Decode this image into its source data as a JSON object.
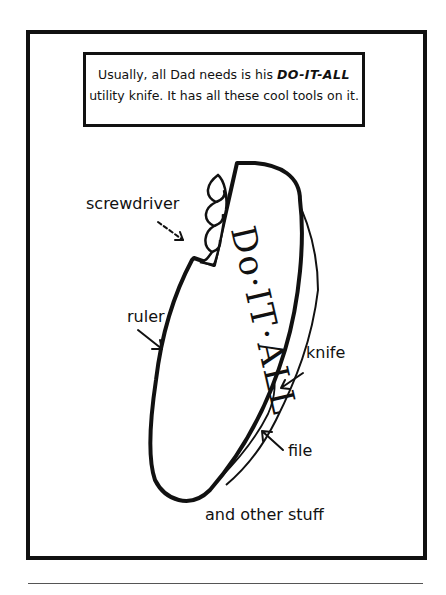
{
  "caption": {
    "line1_prefix": "Usually, all Dad needs is his ",
    "line1_emphasis": "DO-IT-ALL",
    "line2": "utility knife. It has all these cool tools on it."
  },
  "knife": {
    "brand_text": "Do·IT·ALL"
  },
  "labels": {
    "screwdriver": "screwdriver",
    "ruler": "ruler",
    "knife": "knife",
    "file": "file",
    "other": "and other stuff"
  },
  "colors": {
    "ink": "#111111",
    "background": "#ffffff"
  }
}
